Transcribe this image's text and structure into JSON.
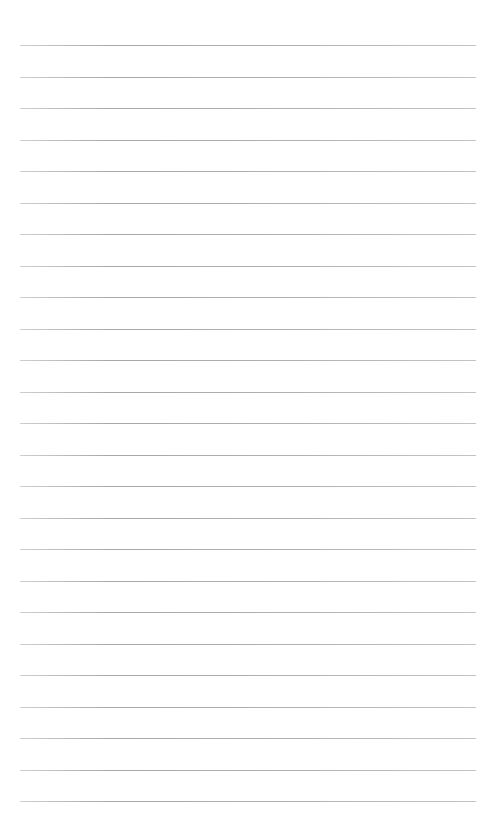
{
  "page": {
    "type": "lined-paper",
    "background_color": "#ffffff",
    "line_color": "#a6a6a6",
    "line_count": 25,
    "first_line_y": 45,
    "line_spacing": 31.5,
    "line_left": 20,
    "line_right": 476
  }
}
